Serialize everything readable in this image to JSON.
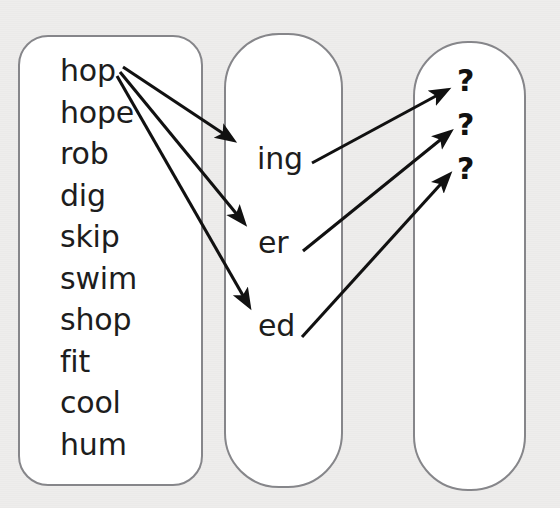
{
  "diagram": {
    "background_color": "#eeedec",
    "box_fill_color": "#ffffff",
    "box_stroke_color": "#86868a",
    "text_color": "#1d1d1d",
    "arrow_color": "#111111"
  },
  "columns": {
    "stems": {
      "name": "stems-column",
      "words": [
        "hop",
        "hope",
        "rob",
        "dig",
        "skip",
        "swim",
        "shop",
        "fit",
        "cool",
        "hum"
      ]
    },
    "suffixes": {
      "name": "suffixes-column",
      "items": [
        "ing",
        "er",
        "ed"
      ]
    },
    "results": {
      "name": "results-column",
      "items": [
        "?",
        "?",
        "?"
      ]
    }
  },
  "arrows": [
    {
      "name": "arrow-hop-to-ing",
      "from": "hop",
      "to": "ing"
    },
    {
      "name": "arrow-hop-to-er",
      "from": "hop",
      "to": "er"
    },
    {
      "name": "arrow-hop-to-ed",
      "from": "hop",
      "to": "ed"
    },
    {
      "name": "arrow-ing-to-result-1",
      "from": "ing",
      "to": "?"
    },
    {
      "name": "arrow-er-to-result-2",
      "from": "er",
      "to": "?"
    },
    {
      "name": "arrow-ed-to-result-3",
      "from": "ed",
      "to": "?"
    }
  ]
}
